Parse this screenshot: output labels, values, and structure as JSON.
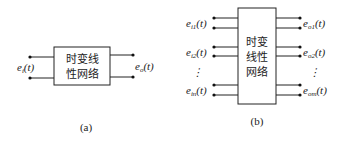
{
  "figure_a": {
    "box_lines": [
      "时变线",
      "性网络"
    ],
    "input_label": {
      "base": "e",
      "sub": "i",
      "arg": "(t)"
    },
    "output_label": {
      "base": "e",
      "sub": "o",
      "arg": "(t)"
    },
    "caption": "(a)"
  },
  "figure_b": {
    "box_lines": [
      "时变",
      "线性",
      "网络"
    ],
    "inputs": [
      {
        "base": "e",
        "sub": "i1",
        "arg": "(t)"
      },
      {
        "base": "e",
        "sub": "i2",
        "arg": "(t)"
      },
      {
        "base": "e",
        "sub": "in",
        "arg": "(t)"
      }
    ],
    "outputs": [
      {
        "base": "e",
        "sub": "o1",
        "arg": "(t)"
      },
      {
        "base": "e",
        "sub": "o2",
        "arg": "(t)"
      },
      {
        "base": "e",
        "sub": "om",
        "arg": "(t)"
      }
    ],
    "ellipsis": "⋮",
    "caption": "(b)"
  }
}
